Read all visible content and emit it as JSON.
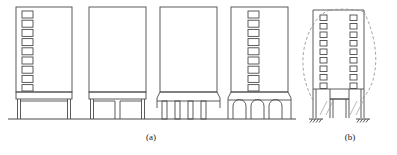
{
  "figure": {
    "type": "engineering-line-drawing",
    "width": 397,
    "height": 155,
    "stroke_color": "#4a4a4a",
    "dashed_color": "#8c8c8c",
    "background_color": "#ffffff",
    "captions": [
      {
        "id": "a",
        "label": "(a)",
        "x": 131,
        "y": 132
      },
      {
        "id": "b",
        "label": "(b)",
        "x": 330,
        "y": 132
      }
    ],
    "panel_a": {
      "label": "(a)",
      "buildings": [
        {
          "name": "building-1-open-front",
          "x": 16,
          "width": 56,
          "top": 7,
          "body_bottom": 92,
          "ground": 119,
          "window_columns": 1,
          "window_rows": 9,
          "window_x": 22,
          "window_w": 11,
          "window_h": 7,
          "window_gap": 2.2,
          "base_style": "single-wide-opening",
          "base_openings": 1
        },
        {
          "name": "building-2-two-openings",
          "x": 89,
          "width": 57,
          "top": 7,
          "body_bottom": 92,
          "ground": 119,
          "window_columns": 0,
          "window_rows": 0,
          "base_style": "two-openings",
          "base_openings": 2
        },
        {
          "name": "building-3-flared-columns",
          "x": 160,
          "width": 57,
          "top": 7,
          "body_bottom": 92,
          "ground": 119,
          "window_columns": 0,
          "window_rows": 0,
          "base_style": "flared-transition-columns",
          "base_openings": 4
        },
        {
          "name": "building-4-arched-columns",
          "x": 231,
          "width": 57,
          "top": 7,
          "body_bottom": 92,
          "ground": 119,
          "window_columns": 1,
          "window_rows": 9,
          "window_x": 248,
          "window_w": 11,
          "window_h": 7,
          "window_gap": 2.2,
          "base_style": "arched-openings",
          "base_openings": 4
        }
      ]
    },
    "panel_b": {
      "label": "(b)",
      "building": {
        "name": "deformed-building",
        "x": 312,
        "width": 52,
        "top": 10,
        "body_bottom": 89,
        "ground": 119,
        "window_columns": 2,
        "window_rows": 9,
        "deformed": true,
        "dashed_deflection_curve": true,
        "supports": [
          {
            "name": "fixed-support-left",
            "x": 318,
            "y": 119
          },
          {
            "name": "fixed-support-right",
            "x": 358,
            "y": 119
          }
        ]
      }
    }
  }
}
